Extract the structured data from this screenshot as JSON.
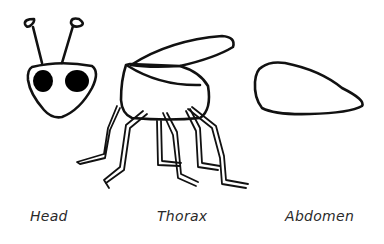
{
  "diagram": {
    "title": "",
    "stroke_color": "#111111",
    "fill_eye_color": "#000000",
    "parts": [
      {
        "id": "head",
        "label": "Head"
      },
      {
        "id": "thorax",
        "label": "Thorax"
      },
      {
        "id": "abdomen",
        "label": "Abdomen"
      }
    ]
  }
}
